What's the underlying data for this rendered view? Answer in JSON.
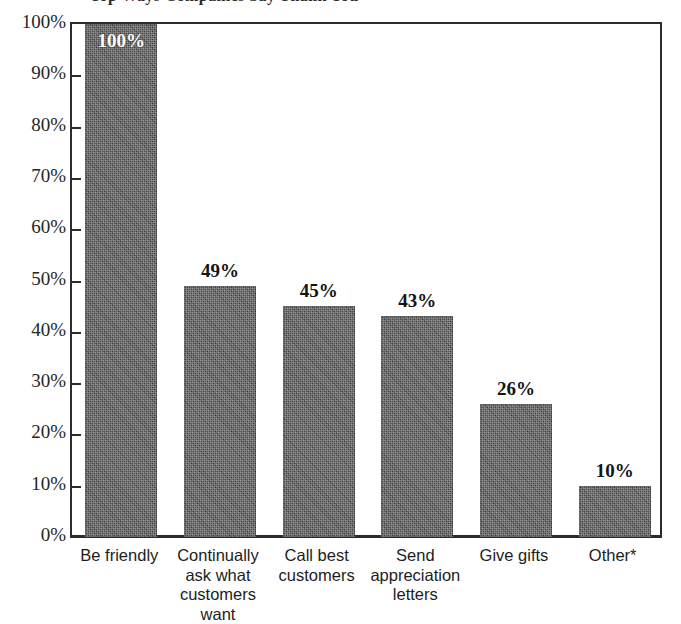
{
  "chart_data": {
    "type": "bar",
    "title": "",
    "xlabel": "",
    "ylabel": "",
    "ylim": [
      0,
      100
    ],
    "grid": false,
    "legend": "none",
    "categories": [
      "Be friendly",
      "Continually ask what customers want",
      "Call best customers",
      "Send appreciation letters",
      "Give gifts",
      "Other*"
    ],
    "values": [
      100,
      49,
      45,
      43,
      26,
      10
    ],
    "value_labels": [
      "100%",
      "49%",
      "45%",
      "43%",
      "26%",
      "10%"
    ],
    "ytick_labels": [
      "100%",
      "90%",
      "80%",
      "70%",
      "60%",
      "50%",
      "40%",
      "30%",
      "20%",
      "10%",
      "0%"
    ],
    "ytick_values": [
      100,
      90,
      80,
      70,
      60,
      50,
      40,
      30,
      20,
      10,
      0
    ],
    "bar_color": "#4d4d4d",
    "axis_color": "#2c2c2c",
    "background_color": "#ffffff",
    "annotations": [
      "Other* is footnoted"
    ]
  },
  "category_lines": [
    [
      "Be friendly"
    ],
    [
      "Continually",
      "ask what",
      "customers want"
    ],
    [
      "Call best",
      "customers"
    ],
    [
      "Send",
      "appreciation",
      "letters"
    ],
    [
      "Give gifts"
    ],
    [
      "Other*"
    ]
  ],
  "title_sliver": {
    "text": "Top Ways Companies Say Thank You"
  }
}
